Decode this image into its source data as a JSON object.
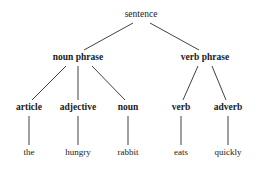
{
  "figure": {
    "type": "syntax-parse-tree",
    "sentence_text": "the hungry rabbit eats quickly",
    "background_color": "#ffffff",
    "line_color": "#2b2b2b",
    "text_color": "#1a1a1a"
  },
  "nodes": {
    "root": {
      "label": "sentence",
      "x": 141,
      "y": 15,
      "level": 1,
      "style": "regular"
    },
    "level2": [
      {
        "label": "noun phrase",
        "x": 78,
        "y": 58,
        "style": "bold"
      },
      {
        "label": "verb phrase",
        "x": 205,
        "y": 58,
        "style": "bold"
      }
    ],
    "level3": [
      {
        "label": "article",
        "x": 29,
        "y": 108,
        "style": "bold"
      },
      {
        "label": "adjective",
        "x": 78,
        "y": 108,
        "style": "bold"
      },
      {
        "label": "noun",
        "x": 128,
        "y": 108,
        "style": "bold"
      },
      {
        "label": "verb",
        "x": 181,
        "y": 108,
        "style": "bold"
      },
      {
        "label": "adverb",
        "x": 228,
        "y": 108,
        "style": "bold"
      }
    ],
    "leaves": [
      {
        "label": "the",
        "x": 29,
        "y": 152,
        "style": "regular"
      },
      {
        "label": "hungry",
        "x": 78,
        "y": 152,
        "style": "regular"
      },
      {
        "label": "rabbit",
        "x": 128,
        "y": 152,
        "style": "regular"
      },
      {
        "label": "eats",
        "x": 181,
        "y": 152,
        "style": "regular"
      },
      {
        "label": "quickly",
        "x": 228,
        "y": 152,
        "style": "regular"
      }
    ]
  },
  "edges": [
    {
      "from": "sentence",
      "to": "noun phrase",
      "x1": 133,
      "y1": 23,
      "x2": 84,
      "y2": 50
    },
    {
      "from": "sentence",
      "to": "verb phrase",
      "x1": 150,
      "y1": 23,
      "x2": 199,
      "y2": 50
    },
    {
      "from": "noun phrase",
      "to": "article",
      "x1": 66,
      "y1": 66,
      "x2": 32,
      "y2": 100
    },
    {
      "from": "noun phrase",
      "to": "adjective",
      "x1": 78,
      "y1": 66,
      "x2": 78,
      "y2": 100
    },
    {
      "from": "noun phrase",
      "to": "noun",
      "x1": 92,
      "y1": 66,
      "x2": 125,
      "y2": 100
    },
    {
      "from": "verb phrase",
      "to": "verb",
      "x1": 198,
      "y1": 66,
      "x2": 183,
      "y2": 100
    },
    {
      "from": "verb phrase",
      "to": "adverb",
      "x1": 212,
      "y1": 66,
      "x2": 226,
      "y2": 100
    },
    {
      "from": "article",
      "to": "the",
      "x1": 29,
      "y1": 116,
      "x2": 29,
      "y2": 145
    },
    {
      "from": "adjective",
      "to": "hungry",
      "x1": 78,
      "y1": 116,
      "x2": 78,
      "y2": 145
    },
    {
      "from": "noun",
      "to": "rabbit",
      "x1": 128,
      "y1": 116,
      "x2": 128,
      "y2": 145
    },
    {
      "from": "verb",
      "to": "eats",
      "x1": 181,
      "y1": 116,
      "x2": 181,
      "y2": 145
    },
    {
      "from": "adverb",
      "to": "quickly",
      "x1": 228,
      "y1": 116,
      "x2": 228,
      "y2": 145
    }
  ]
}
